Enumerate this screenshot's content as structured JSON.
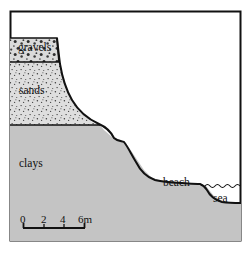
{
  "figure": {
    "frame": {
      "x": 10,
      "y": 11,
      "width": 231,
      "height": 230
    },
    "background_color": "#ffffff",
    "line_color": "#111111"
  },
  "layers": [
    {
      "name": "gravels",
      "label": "gravels",
      "pattern": "coarse-stipple",
      "fill_color": "#d8d8d8",
      "top_y": 38,
      "bottom_y": 62
    },
    {
      "name": "sands",
      "label": "sands",
      "pattern": "fine-stipple",
      "fill_color": "#dcdcdc",
      "top_y": 62,
      "bottom_y": 125
    },
    {
      "name": "clays",
      "label": "clays",
      "pattern": "solid",
      "fill_color": "#c4c4c4",
      "top_y": 125,
      "bottom_y": 241
    }
  ],
  "features": [
    {
      "name": "beach",
      "label": "beach",
      "x": 163,
      "y": 177
    },
    {
      "name": "sea",
      "label": "sea",
      "x": 213,
      "y": 193
    }
  ],
  "sea": {
    "water_line_y": 186,
    "water_line_start_x": 205,
    "water_line_end_x": 241,
    "wave_style": "scalloped"
  },
  "scale_bar": {
    "unit_suffix": "m",
    "ticks": [
      "0",
      "2",
      "4",
      "6m"
    ],
    "tick_values": [
      0,
      2,
      4,
      6
    ],
    "bar_x_start": 23,
    "bar_x_end": 85,
    "bar_y": 228,
    "tick_positions": [
      23,
      44,
      64,
      85
    ]
  },
  "profile": {
    "description": "concave cliff profile descending left to right from plateau top to beach and sea",
    "points": [
      [
        57,
        38
      ],
      [
        59,
        55
      ],
      [
        62,
        72
      ],
      [
        68,
        92
      ],
      [
        78,
        110
      ],
      [
        92,
        122
      ],
      [
        104,
        130
      ],
      [
        112,
        137
      ],
      [
        121,
        140
      ],
      [
        128,
        146
      ],
      [
        136,
        158
      ],
      [
        144,
        170
      ],
      [
        152,
        178
      ],
      [
        168,
        182
      ],
      [
        186,
        183
      ],
      [
        200,
        184
      ],
      [
        206,
        186
      ],
      [
        214,
        196
      ],
      [
        224,
        202
      ],
      [
        241,
        203
      ]
    ]
  }
}
